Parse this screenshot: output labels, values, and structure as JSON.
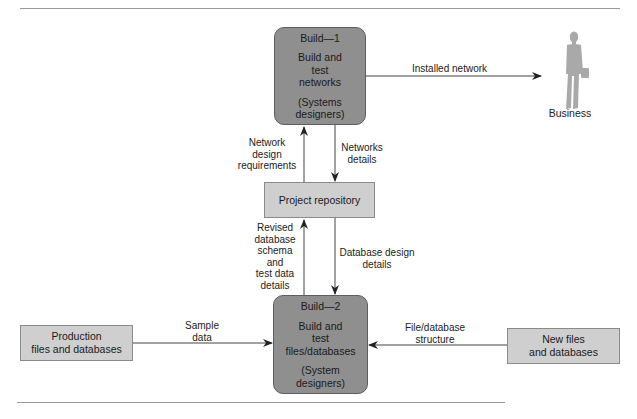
{
  "diagram": {
    "type": "data-flow",
    "processes": [
      {
        "id": "build1",
        "title": "Build—1",
        "action": [
          "Build and",
          "test",
          "networks"
        ],
        "actor": [
          "(Systems",
          "designers)"
        ]
      },
      {
        "id": "build2",
        "title": "Build—2",
        "action": [
          "Build and",
          "test",
          "files/databases"
        ],
        "actor": [
          "(System",
          "designers)"
        ]
      }
    ],
    "stores": [
      {
        "id": "repo",
        "lines": [
          "Project repository"
        ]
      },
      {
        "id": "production",
        "lines": [
          "Production",
          "files and databases"
        ]
      },
      {
        "id": "newfiles",
        "lines": [
          "New files",
          "and databases"
        ]
      }
    ],
    "external": {
      "id": "business",
      "label": "Business",
      "icon": "businessperson-icon"
    },
    "flows": [
      {
        "from": "build1",
        "to": "business",
        "lines": [
          "Installed network"
        ]
      },
      {
        "from": "repo",
        "to": "build1",
        "lines": [
          "Network",
          "design",
          "requirements"
        ]
      },
      {
        "from": "build1",
        "to": "repo",
        "lines": [
          "Networks",
          "details"
        ]
      },
      {
        "from": "build2",
        "to": "repo",
        "lines": [
          "Revised",
          "database",
          "schema",
          "and",
          "test data",
          "details"
        ]
      },
      {
        "from": "repo",
        "to": "build2",
        "lines": [
          "Database design",
          "details"
        ]
      },
      {
        "from": "production",
        "to": "build2",
        "lines": [
          "Sample",
          "data"
        ]
      },
      {
        "from": "newfiles",
        "to": "build2",
        "lines": [
          "File/database",
          "structure"
        ]
      }
    ]
  },
  "colors": {
    "process_fill": "#8f8f8f",
    "store_fill": "#cfcfcf",
    "line": "#333333",
    "figure": "#a9a9a9"
  }
}
